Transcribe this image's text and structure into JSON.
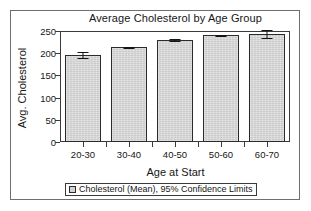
{
  "chart_data": {
    "type": "bar",
    "title": "Average Cholesterol by Age Group",
    "xlabel": "Age at Start",
    "ylabel": "Avg. Cholesterol",
    "categories": [
      "20-30",
      "30-40",
      "40-50",
      "50-60",
      "60-70"
    ],
    "values": [
      195,
      213,
      230,
      240,
      243
    ],
    "error_low": [
      189,
      211,
      228,
      238,
      234
    ],
    "error_high": [
      202,
      215,
      232,
      242,
      252
    ],
    "ylim": [
      0,
      250
    ],
    "yticks": [
      0,
      50,
      100,
      150,
      200,
      250
    ],
    "ytick_labels": [
      "0",
      "50",
      "100",
      "150",
      "200",
      "250"
    ],
    "grid": false,
    "legend_position": "bottom",
    "legend": [
      "Cholesterol (Mean), 95% Confidence Limits"
    ],
    "series": [
      {
        "name": "Cholesterol (Mean), 95% Confidence Limits",
        "values": [
          195,
          213,
          230,
          240,
          243
        ]
      }
    ],
    "colors": {
      "bar_fill": "#d2d2d2",
      "bar_edge": "#2b2b2b",
      "error_bar": "#141414",
      "axis": "#3a3a3a",
      "frame": "#6f6f6f",
      "text": "#161616",
      "background": "#ffffff"
    }
  }
}
